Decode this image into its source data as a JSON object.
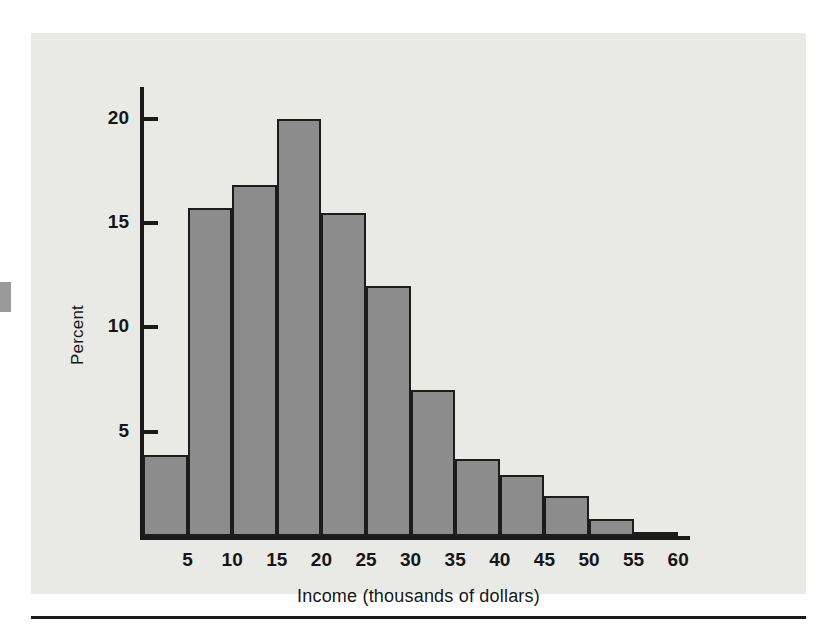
{
  "figure": {
    "background_color": "#e9e9e6",
    "bar_fill_color": "#8c8c8c",
    "bar_border_color": "#1c1c1c",
    "axis_color": "#1a1a1a"
  },
  "chart_data": {
    "type": "bar",
    "title": "",
    "subtitle": "",
    "xlabel": "Income (thousands of dollars)",
    "ylabel": "Percent",
    "xlim": [
      0,
      61
    ],
    "ylim": [
      0,
      21.5
    ],
    "xticks": [
      5,
      10,
      15,
      20,
      25,
      30,
      35,
      40,
      45,
      50,
      55,
      60
    ],
    "xtick_labels": [
      "5",
      "10",
      "15",
      "20",
      "25",
      "30",
      "35",
      "40",
      "45",
      "50",
      "55",
      "60"
    ],
    "yticks": [
      5,
      10,
      15,
      20
    ],
    "ytick_labels": [
      "5",
      "10",
      "15",
      "20"
    ],
    "grid": false,
    "legend": null,
    "bin_width": 5,
    "bin_edges": [
      0,
      5,
      10,
      15,
      20,
      25,
      30,
      35,
      40,
      45,
      50,
      55,
      60
    ],
    "categories": [
      "0-5",
      "5-10",
      "10-15",
      "15-20",
      "20-25",
      "25-30",
      "30-35",
      "35-40",
      "40-45",
      "45-50",
      "50-55",
      "55-60"
    ],
    "values": [
      3.9,
      15.7,
      16.8,
      20.0,
      15.5,
      12.0,
      7.0,
      3.7,
      2.9,
      1.9,
      0.8,
      0.2
    ]
  }
}
